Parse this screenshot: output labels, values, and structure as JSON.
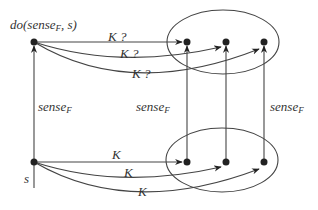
{
  "diagram": {
    "top_state_label": "do(sense",
    "top_state_sub": "F",
    "top_state_tail": ", s)",
    "bottom_state_label": "s",
    "edges_top": [
      "K ?",
      "K ?",
      "K ?"
    ],
    "edges_bottom": [
      "K",
      "K",
      "K"
    ],
    "sense_label": "sense",
    "sense_sub": "F",
    "colors": {
      "stroke": "#444444",
      "node": "#222222"
    }
  }
}
